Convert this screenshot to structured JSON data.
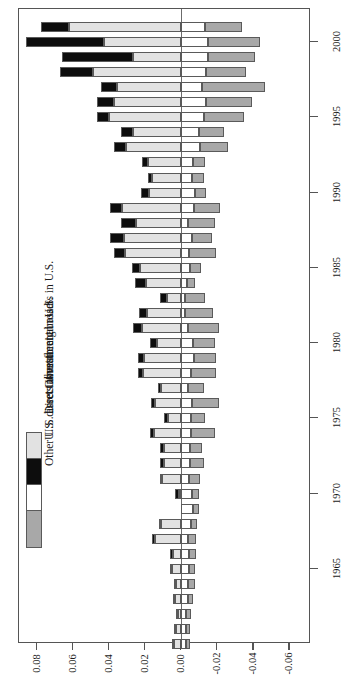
{
  "chart_data": {
    "type": "bar",
    "orientation": "horizontal-rotated",
    "title": "",
    "xlabel": "",
    "ylabel": "Percent of nominal GDP",
    "value_axis_label": "Percent of nominal GDP",
    "value_ticks": [
      "0.08",
      "0.06",
      "0.04",
      "0.02",
      "0.00",
      "-0.02",
      "-0.04",
      "-0.06"
    ],
    "value_tick_values": [
      0.08,
      0.06,
      0.04,
      0.02,
      0.0,
      -0.02,
      -0.04,
      -0.06
    ],
    "value_lim": [
      0.09,
      -0.072
    ],
    "category_ticks": [
      "2000",
      "1995",
      "1990",
      "1985",
      "1980",
      "1975",
      "1970",
      "1965"
    ],
    "grid": false,
    "legend_position": "inside-left",
    "series": [
      {
        "name": "Other foreign assets in U.S.",
        "color": "#e2e2e2",
        "side": "positive"
      },
      {
        "name": "Direct investment in U.S.",
        "color": "#0d0d0d",
        "side": "positive"
      },
      {
        "name": "U.S. direct investment abroad",
        "color": "#ffffff",
        "side": "negative"
      },
      {
        "name": "Other U.S. assets abroad",
        "color": "#a8a8a8",
        "side": "negative"
      }
    ],
    "categories": [
      2001,
      2000,
      1999,
      1998,
      1997,
      1996,
      1995,
      1994,
      1993,
      1992,
      1991,
      1990,
      1989,
      1988,
      1987,
      1986,
      1985,
      1984,
      1983,
      1982,
      1981,
      1980,
      1979,
      1978,
      1977,
      1976,
      1975,
      1974,
      1973,
      1972,
      1971,
      1970,
      1969,
      1968,
      1967,
      1966,
      1965,
      1964,
      1963,
      1962,
      1961,
      1960
    ],
    "values": {
      "other_foreign_assets_in_us": [
        0.0625,
        0.043,
        0.027,
        0.049,
        0.0355,
        0.0375,
        0.04,
        0.027,
        0.0305,
        0.0185,
        0.016,
        0.018,
        0.033,
        0.025,
        0.0315,
        0.031,
        0.023,
        0.0195,
        0.008,
        0.019,
        0.0215,
        0.0135,
        0.0205,
        0.021,
        0.011,
        0.0145,
        0.0075,
        0.015,
        0.0095,
        0.0095,
        0.0105,
        0.0015,
        -0.0045,
        0.011,
        0.0145,
        0.0045,
        0.005,
        0.003,
        0.0035,
        0.002,
        0.003,
        0.004
      ],
      "direct_investment_in_us": [
        0.0155,
        0.043,
        0.039,
        0.0185,
        0.009,
        0.009,
        0.007,
        0.0065,
        0.007,
        0.003,
        0.0025,
        0.0045,
        0.0065,
        0.0085,
        0.008,
        0.0065,
        0.0045,
        0.006,
        0.0035,
        0.0045,
        0.005,
        0.004,
        0.0035,
        0.003,
        0.002,
        0.0025,
        0.002,
        0.0025,
        0.002,
        0.002,
        0.0015,
        0.002,
        0.0015,
        0.0015,
        0.0015,
        0.0015,
        0.0015,
        0.001,
        0.001,
        0.001,
        0.001,
        0.001
      ],
      "us_direct_investment_abroad": [
        -0.013,
        -0.015,
        -0.015,
        -0.0135,
        -0.0115,
        -0.014,
        -0.0125,
        -0.01,
        -0.0105,
        -0.0065,
        -0.006,
        -0.0075,
        -0.007,
        -0.0035,
        -0.006,
        -0.0045,
        -0.005,
        -0.003,
        -0.002,
        -0.002,
        -0.0035,
        -0.0065,
        -0.007,
        -0.0055,
        -0.004,
        -0.006,
        -0.0055,
        -0.0055,
        -0.005,
        -0.005,
        -0.0045,
        -0.006,
        -0.0065,
        -0.0055,
        -0.004,
        -0.0045,
        -0.0045,
        -0.004,
        -0.0035,
        -0.0025,
        -0.0025,
        -0.0025
      ],
      "other_us_assets_abroad": [
        -0.0205,
        -0.0285,
        -0.026,
        -0.0225,
        -0.035,
        -0.0255,
        -0.0225,
        -0.014,
        -0.0155,
        -0.0065,
        -0.0065,
        -0.0065,
        -0.0145,
        -0.0155,
        -0.011,
        -0.015,
        -0.006,
        -0.0045,
        -0.011,
        -0.0155,
        -0.0175,
        -0.012,
        -0.0125,
        -0.014,
        -0.0085,
        -0.015,
        -0.0075,
        -0.013,
        -0.0065,
        -0.0075,
        -0.006,
        -0.004,
        -0.0035,
        -0.003,
        -0.004,
        -0.0035,
        -0.003,
        -0.0035,
        -0.003,
        -0.003,
        -0.0025,
        -0.0025
      ]
    }
  },
  "legend": {
    "items": [
      {
        "label": "Other foreign assets in U.S.",
        "swatch": "#e2e2e2"
      },
      {
        "label": "Direct investment in U.S.",
        "swatch": "#0d0d0d"
      },
      {
        "label": "U.S. direct investment abroad",
        "swatch": "#ffffff"
      },
      {
        "label": "Other U.S. assets abroad",
        "swatch": "#a8a8a8"
      }
    ]
  }
}
